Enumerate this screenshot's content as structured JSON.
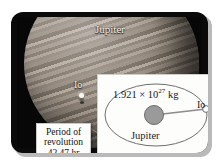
{
  "figure": {
    "photo": {
      "planet_label": "Jupiter",
      "moon_label": "Io"
    },
    "inset": {
      "mass_prefix": "1.921 × 10",
      "mass_exponent": "27",
      "mass_unit": " kg",
      "central_body_label": "Jupiter",
      "orbiting_body_label": "Io"
    },
    "callout": {
      "line1": "Period of",
      "line2": "revolution",
      "line3": "42.47 hr"
    },
    "colors": {
      "frame": "#0a0a0a",
      "panel": "#fdfdfb",
      "planet_fill": "#9a9a9a",
      "orbit_stroke": "#6e6e6e",
      "moon_fill": "#ffffff"
    }
  }
}
